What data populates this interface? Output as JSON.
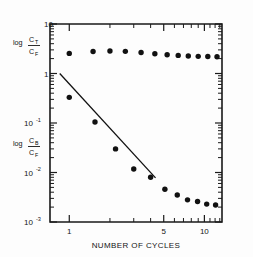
{
  "chart_data": {
    "type": "scatter",
    "title": "",
    "xlabel": "NUMBER OF CYCLES",
    "ylabel_top": "log C_T/C_F",
    "ylabel_bottom": "log C_B/C_F",
    "xscale": "log",
    "yscale": "log",
    "xlim": [
      0.72,
      13.5
    ],
    "ylim": [
      0.001,
      10
    ],
    "xticks": [
      1,
      5,
      10
    ],
    "xtick_labels": [
      "1",
      "5",
      "10"
    ],
    "yticks": [
      10,
      1,
      0.1,
      0.01,
      0.001
    ],
    "ytick_labels": [
      "10",
      "1",
      "10-1",
      "10-2",
      "10-3"
    ],
    "grid": false,
    "legend": "none",
    "series": [
      {
        "name": "log C_T/C_F",
        "marker": "filled-circle",
        "x": [
          1.0,
          1.5,
          2.0,
          2.6,
          3.4,
          4.3,
          5.3,
          6.4,
          7.6,
          9.0,
          10.6,
          12.4
        ],
        "y": [
          2.55,
          2.78,
          2.85,
          2.8,
          2.66,
          2.5,
          2.4,
          2.32,
          2.26,
          2.22,
          2.2,
          2.18
        ]
      },
      {
        "name": "log C_B/C_F",
        "marker": "filled-circle",
        "x": [
          1.0,
          1.55,
          2.2,
          3.0,
          4.0,
          5.1,
          6.3,
          7.5,
          8.9,
          10.4,
          12.1
        ],
        "y": [
          0.33,
          0.105,
          0.03,
          0.0118,
          0.008,
          0.0046,
          0.0035,
          0.0028,
          0.0026,
          0.0023,
          0.0022
        ]
      }
    ],
    "fit_line": {
      "name": "first-order decay fit",
      "style": "solid-thin",
      "x_start": 0.85,
      "y_start": 1.0,
      "x_end": 4.35,
      "y_end": 0.0078
    },
    "annotations": []
  },
  "axis": {
    "x_title": "NUMBER OF CYCLES",
    "ytop_log": "log",
    "ytop_num": "C",
    "ytop_num_sub": "T",
    "ytop_den": "C",
    "ytop_den_sub": "F",
    "ybot_log": "log",
    "ybot_num": "C",
    "ybot_num_sub": "B",
    "ybot_den": "C",
    "ybot_den_sub": "F"
  },
  "ticks": {
    "y": [
      {
        "label": "10",
        "exp": "",
        "value": 10
      },
      {
        "label": "1",
        "exp": "",
        "value": 1
      },
      {
        "label": "10",
        "exp": "-1",
        "value": 0.1
      },
      {
        "label": "10",
        "exp": "-2",
        "value": 0.01
      },
      {
        "label": "10",
        "exp": "-3",
        "value": 0.001
      }
    ],
    "x": [
      {
        "label": "1",
        "value": 1
      },
      {
        "label": "5",
        "value": 5
      },
      {
        "label": "10",
        "value": 10
      }
    ]
  }
}
